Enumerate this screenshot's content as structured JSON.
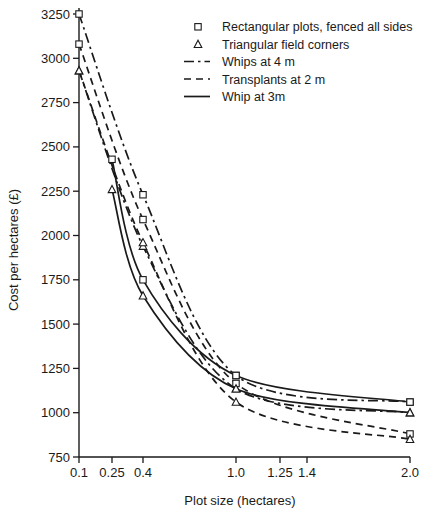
{
  "chart_data": {
    "type": "line",
    "title": "",
    "xlabel": "Plot size (hectares)",
    "ylabel": "Cost per hectares (£)",
    "x_ticks": [
      0.1,
      0.25,
      0.4,
      1.0,
      1.25,
      1.4,
      2.0
    ],
    "x_tick_labels": [
      "0.1",
      "0.25",
      "0.4",
      "1.0",
      "1.25",
      "1.4",
      "2.0"
    ],
    "x_scale": "non-linear (compressed at low values)",
    "y_ticks": [
      750,
      1000,
      1250,
      1500,
      1750,
      2000,
      2250,
      2500,
      2750,
      3000,
      3250
    ],
    "y_tick_labels": [
      "750",
      "1000",
      "1250",
      "1500",
      "1750",
      "2000",
      "2250",
      "2500",
      "2750",
      "3000",
      "3250"
    ],
    "ylim": [
      700,
      3300
    ],
    "grid": false,
    "legend_position": "upper right",
    "markers": [
      {
        "name": "Rectangular plots, fenced all sides",
        "shape": "square"
      },
      {
        "name": "Triangular field corners",
        "shape": "triangle"
      }
    ],
    "linestyles": [
      {
        "name": "Whips at 4 m",
        "style": "dash-dot"
      },
      {
        "name": "Transplants at 2 m",
        "style": "dashed"
      },
      {
        "name": "Whip at 3m",
        "style": "solid"
      }
    ],
    "series": [
      {
        "name": "Whips at 4 m — Rectangular plots, fenced all sides",
        "linestyle": "dash-dot",
        "marker": "square",
        "x": [
          0.1,
          0.4,
          1.0,
          2.0
        ],
        "y": [
          3250,
          2230,
          1210,
          1060
        ]
      },
      {
        "name": "Whips at 4 m — Triangular field corners",
        "linestyle": "dash-dot",
        "marker": "triangle",
        "x": [
          0.1,
          0.4,
          1.0,
          2.0
        ],
        "y": [
          2930,
          1940,
          1135,
          1000
        ]
      },
      {
        "name": "Transplants at 2 m — Rectangular plots, fenced all sides",
        "linestyle": "dashed",
        "marker": "square",
        "x": [
          0.1,
          0.4,
          1.0,
          2.0
        ],
        "y": [
          3080,
          2090,
          1165,
          880
        ]
      },
      {
        "name": "Transplants at 2 m — Triangular field corners",
        "linestyle": "dashed",
        "marker": "triangle",
        "x": [
          0.1,
          0.4,
          1.0,
          2.0
        ],
        "y": [
          2930,
          1960,
          1060,
          850
        ]
      },
      {
        "name": "Whip at 3m — Rectangular plots, fenced all sides",
        "linestyle": "solid",
        "marker": "square",
        "x": [
          0.25,
          0.4,
          1.0,
          2.0
        ],
        "y": [
          2430,
          1750,
          1210,
          1060
        ]
      },
      {
        "name": "Whip at 3m — Triangular field corners",
        "linestyle": "solid",
        "marker": "triangle",
        "x": [
          0.25,
          0.4,
          1.0,
          2.0
        ],
        "y": [
          2260,
          1660,
          1135,
          1000
        ]
      }
    ]
  },
  "legend": {
    "items": [
      {
        "label": "Rectangular plots, fenced all sides",
        "glyph": "square-marker"
      },
      {
        "label": "Triangular field corners",
        "glyph": "triangle-marker"
      },
      {
        "label": "Whips at 4 m",
        "glyph": "dash-dot-line"
      },
      {
        "label": "Transplants at 2 m",
        "glyph": "dashed-line"
      },
      {
        "label": "Whip at 3m",
        "glyph": "solid-line"
      }
    ]
  },
  "axes": {
    "x_title": "Plot size (hectares)",
    "y_title": "Cost per hectares (£)"
  },
  "colors": {
    "ink": "#1a1a1a",
    "background": "#ffffff"
  }
}
